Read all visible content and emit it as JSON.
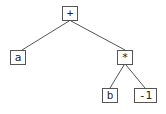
{
  "diagram": {
    "type": "expression-tree",
    "expression": "a + (b * -1)",
    "nodes": [
      {
        "id": "plus",
        "label": "+",
        "x": 62,
        "y": 6,
        "w": 16,
        "h": 15
      },
      {
        "id": "a",
        "label": "a",
        "x": 10,
        "y": 50,
        "w": 16,
        "h": 15
      },
      {
        "id": "times",
        "label": "*",
        "x": 117,
        "y": 50,
        "w": 16,
        "h": 15
      },
      {
        "id": "b",
        "label": "b",
        "x": 102,
        "y": 88,
        "w": 16,
        "h": 15
      },
      {
        "id": "neg1",
        "label": "-1",
        "x": 134,
        "y": 88,
        "w": 23,
        "h": 15
      }
    ],
    "edges": [
      {
        "from": "plus",
        "to": "a"
      },
      {
        "from": "plus",
        "to": "times"
      },
      {
        "from": "times",
        "to": "b"
      },
      {
        "from": "times",
        "to": "neg1"
      }
    ],
    "colors": {
      "line": "#555555",
      "border": "#555555",
      "text": "#222222",
      "background": "#ffffff"
    }
  }
}
